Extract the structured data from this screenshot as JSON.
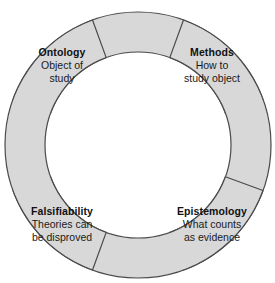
{
  "diagram": {
    "type": "cycle",
    "background_color": "#ffffff",
    "segment_fill_color": "#d8d8d8",
    "segment_stroke_color": "#4a4a4a",
    "text_color": "#1a1a1a",
    "center": {
      "x": 138,
      "y": 145
    },
    "outer_radius": 133,
    "inner_radius": 93,
    "segments": [
      {
        "name": "top-segment",
        "position": "top",
        "start_angle": -160,
        "end_angle": -20
      },
      {
        "name": "right-segment",
        "position": "right",
        "start_angle": -70,
        "end_angle": 70
      },
      {
        "name": "bottom-segment",
        "position": "bottom",
        "start_angle": 20,
        "end_angle": 160
      },
      {
        "name": "left-segment",
        "position": "left",
        "start_angle": 110,
        "end_angle": 250
      }
    ],
    "labels": [
      {
        "key": "ontology",
        "title": "Ontology",
        "lines": [
          "Object of",
          "study"
        ]
      },
      {
        "key": "methods",
        "title": "Methods",
        "lines": [
          "How to",
          "study object"
        ]
      },
      {
        "key": "falsifiability",
        "title": "Falsifiability",
        "lines": [
          "Theories can",
          "be disproved"
        ]
      },
      {
        "key": "epistemology",
        "title": "Epistemology",
        "lines": [
          "What counts",
          "as evidence"
        ]
      }
    ]
  }
}
